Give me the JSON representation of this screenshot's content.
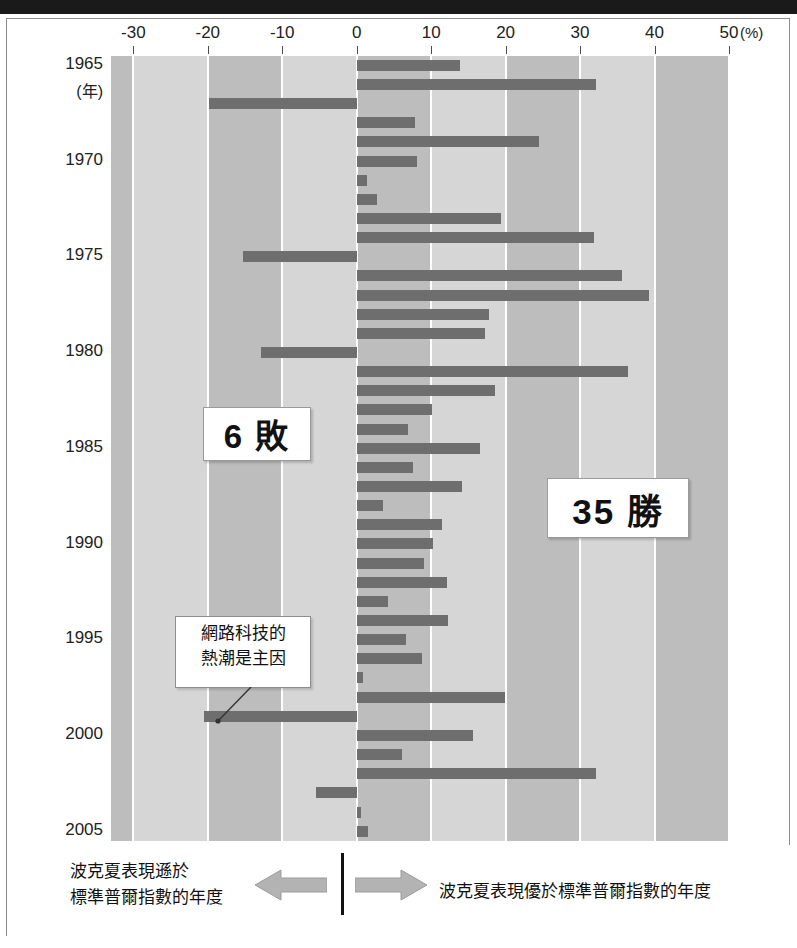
{
  "axis": {
    "x_ticks": [
      -30,
      -20,
      -10,
      0,
      10,
      20,
      30,
      40,
      50
    ],
    "x_tick_labels": [
      "-30",
      "-20",
      "-10",
      "0",
      "10",
      "20",
      "30",
      "40",
      "50"
    ],
    "percent_suffix": "(%)",
    "xmin": -33,
    "xmax": 50,
    "year_ticks": [
      1965,
      1970,
      1975,
      1980,
      1985,
      1990,
      1995,
      2000,
      2005
    ],
    "year_unit_label": "(年)"
  },
  "callouts": {
    "losses": "6 敗",
    "wins": "35 勝"
  },
  "annotation": {
    "line1": "網路科技的",
    "line2": "熱潮是主因"
  },
  "legend": {
    "left_line1": "波克夏表現遜於",
    "left_line2": "標準普爾指數的年度",
    "right": "波克夏表現優於標準普爾指數的年度",
    "arrow_left_icon": "arrow-left-icon",
    "arrow_right_icon": "arrow-right-icon"
  },
  "colors": {
    "bar": "#6e6e6e",
    "band_dark": "#bdbdbd",
    "band_light": "#d6d6d6",
    "gridline": "#ffffff",
    "frame": "#8d8d8d",
    "top_band": "#1a1a1a"
  },
  "chart_data": {
    "type": "bar",
    "orientation": "horizontal",
    "title": "",
    "subtitle": "",
    "xlabel": "(%)",
    "ylabel": "(年)",
    "xlim": [
      -33,
      50
    ],
    "grid": true,
    "legend_position": "bottom",
    "categories": [
      1965,
      1966,
      1967,
      1968,
      1969,
      1970,
      1971,
      1972,
      1973,
      1974,
      1975,
      1976,
      1977,
      1978,
      1979,
      1980,
      1981,
      1982,
      1983,
      1984,
      1985,
      1986,
      1987,
      1988,
      1989,
      1990,
      1991,
      1992,
      1993,
      1994,
      1995,
      1996,
      1997,
      1998,
      1999,
      2000,
      2001,
      2002,
      2003,
      2004,
      2005
    ],
    "values": [
      13.9,
      32.2,
      -19.9,
      7.8,
      24.5,
      8.1,
      1.4,
      2.7,
      19.4,
      31.9,
      -15.3,
      35.6,
      39.3,
      17.8,
      17.2,
      -12.8,
      36.4,
      18.6,
      10.1,
      6.9,
      16.5,
      7.5,
      14.2,
      3.5,
      11.4,
      10.2,
      9.0,
      12.1,
      4.2,
      12.3,
      6.6,
      8.8,
      0.8,
      19.9,
      -20.5,
      15.6,
      6.1,
      32.1,
      -5.5,
      0.6,
      1.5
    ],
    "value_unit": "%",
    "series_name": "波克夏相對標準普爾指數的年度超額報酬",
    "positive_count": 35,
    "negative_count": 6,
    "negative_years": [
      1967,
      1975,
      1980,
      1999
    ],
    "annotations": [
      {
        "year": 1999,
        "text": "網路科技的熱潮是主因"
      }
    ]
  }
}
